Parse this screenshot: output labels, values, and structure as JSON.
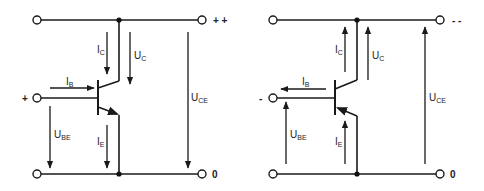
{
  "diagrams": [
    {
      "type": "NPN transistor",
      "supply_label": "+ +",
      "base_polarity": "+",
      "ground_label": "0",
      "labels": {
        "IC": {
          "main": "I",
          "sub": "C"
        },
        "UC": {
          "main": "U",
          "sub": "C"
        },
        "IB": {
          "main": "I",
          "sub": "B"
        },
        "UBE": {
          "main": "U",
          "sub": "BE"
        },
        "IE": {
          "main": "I",
          "sub": "E"
        },
        "UCE": {
          "main": "U",
          "sub": "CE"
        }
      }
    },
    {
      "type": "PNP transistor",
      "supply_label": "- -",
      "base_polarity": "-",
      "ground_label": "0",
      "labels": {
        "IC": {
          "main": "I",
          "sub": "C"
        },
        "UC": {
          "main": "U",
          "sub": "C"
        },
        "IB": {
          "main": "I",
          "sub": "B"
        },
        "UBE": {
          "main": "U",
          "sub": "BE"
        },
        "IE": {
          "main": "I",
          "sub": "E"
        },
        "UCE": {
          "main": "U",
          "sub": "CE"
        }
      }
    }
  ]
}
